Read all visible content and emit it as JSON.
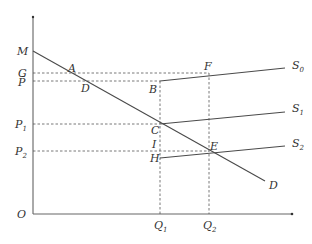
{
  "diagram": {
    "axes": {
      "origin_label": "O",
      "x_ticks": [
        {
          "label": "Q",
          "sub": "1",
          "x": 160
        },
        {
          "label": "Q",
          "sub": "2",
          "x": 209
        }
      ],
      "y_ticks": [
        {
          "label": "M",
          "sub": "",
          "y": 51
        },
        {
          "label": "G",
          "sub": "",
          "y": 73
        },
        {
          "label": "P̄",
          "sub": "",
          "y": 81
        },
        {
          "label": "P",
          "sub": "1",
          "y": 124
        },
        {
          "label": "P",
          "sub": "2",
          "y": 151
        }
      ]
    },
    "curves": [
      {
        "name": "D",
        "label": "D",
        "sub": ""
      },
      {
        "name": "S0",
        "label": "S",
        "sub": "0"
      },
      {
        "name": "S1",
        "label": "S",
        "sub": "1"
      },
      {
        "name": "S2",
        "label": "S",
        "sub": "2"
      }
    ],
    "points": {
      "A": "A",
      "B": "B",
      "C": "C",
      "D": "D",
      "E": "E",
      "F": "F",
      "H": "H",
      "I": "I"
    },
    "colors": {
      "line": "#4a4a4a",
      "dashed": "#555555",
      "text": "#333333"
    }
  }
}
